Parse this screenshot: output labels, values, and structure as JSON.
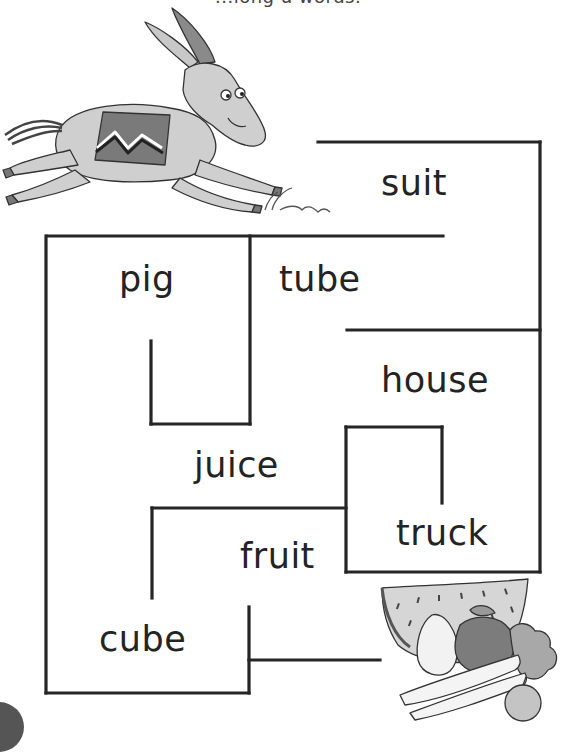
{
  "instruction": {
    "text": "Help the donkey get to the fruit. Follow the path through the long u words.",
    "visible_fragment": "...long u words."
  },
  "illustrations": {
    "start": "donkey-running",
    "finish": "fruit-basket"
  },
  "maze": {
    "line_color": "#262626",
    "words": [
      {
        "id": "suit",
        "label": "suit"
      },
      {
        "id": "pig",
        "label": "pig"
      },
      {
        "id": "tube",
        "label": "tube"
      },
      {
        "id": "house",
        "label": "house"
      },
      {
        "id": "juice",
        "label": "juice"
      },
      {
        "id": "truck",
        "label": "truck"
      },
      {
        "id": "fruit",
        "label": "fruit"
      },
      {
        "id": "cube",
        "label": "cube"
      }
    ]
  }
}
